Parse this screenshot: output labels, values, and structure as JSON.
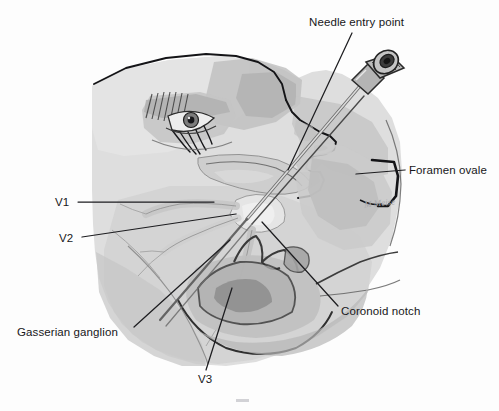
{
  "figure": {
    "background_color": "#fdfdfd",
    "width": 499,
    "height": 411,
    "signature": "M Meise",
    "style": "grayscale medical line illustration"
  },
  "labels": {
    "needle_entry": "Needle entry point",
    "foramen_ovale": "Foramen ovale",
    "coronoid_notch": "Coronoid notch",
    "gasserian_ganglion": "Gasserian ganglion",
    "v1": "V1",
    "v2": "V2",
    "v3": "V3"
  },
  "palette": {
    "outline": "#141417",
    "leader_line": "#1d1d20",
    "skin_light": "#dcdcdc",
    "skin_mid": "#c9c9c9",
    "skin_shadow": "#b2b2b2",
    "bone_light": "#d4d4d4",
    "bone_mid": "#bcbcbc",
    "bone_dark": "#9d9d9d",
    "nerve_pale": "#e3e3e3",
    "muscle": "#a8a8a8",
    "deep_shadow": "#8a8a8a",
    "needle_shaft": "#cfcfcf",
    "hub_body": "#b4b4b4",
    "hub_dark": "#2a2a2a",
    "text": "#17171a",
    "signature": "#a9a9ad"
  },
  "anatomy": {
    "view": "left lateral profile of head, semi-transparent to reveal skull and trigeminal nerve",
    "structures": [
      "facial profile with eye and eyelashes",
      "nose and lips",
      "zygomatic arch",
      "mandible with coronoid notch",
      "skull base and foramen ovale",
      "Gasserian (trigeminal) ganglion",
      "V1 ophthalmic division",
      "V2 maxillary division",
      "V3 mandibular division",
      "block needle with luer-lock hub"
    ]
  }
}
